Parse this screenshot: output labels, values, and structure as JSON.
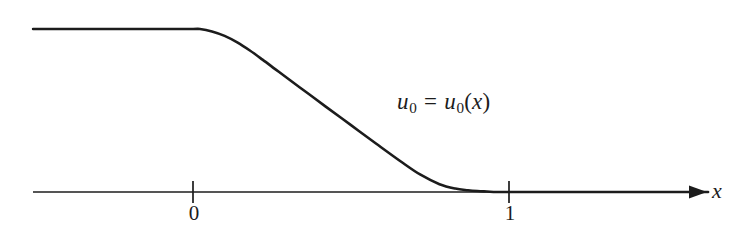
{
  "figure": {
    "background_color": "#ffffff",
    "ink_color": "#1c1c1c",
    "width": 745,
    "height": 242,
    "curve_label": {
      "full_text": "u0 = u0(x)",
      "lhs_var": "u",
      "lhs_sub": "0",
      "equals": "=",
      "rhs_var": "u",
      "rhs_sub": "0",
      "open_paren": "(",
      "arg": "x",
      "close_paren": ")"
    },
    "axis": {
      "x_axis_label": "x",
      "tick_labels": [
        "0",
        "1"
      ]
    }
  },
  "chart_data": {
    "type": "line",
    "title": "",
    "subtitle": "",
    "xlabel": "x",
    "ylabel": "",
    "grid": false,
    "legend_position": "none",
    "annotations": [
      {
        "text": "u0 = u0(x)",
        "x": 0.64,
        "y": 0.58,
        "note": "curve label placed to the right of the descending branch"
      }
    ],
    "axis_pixel_geometry": {
      "axis_y_pixel": 192,
      "axis_x_start_pixel": 33,
      "axis_x_end_pixel": 706,
      "tick_0_x_pixel": 193,
      "tick_1_x_pixel": 509,
      "tick_half_height_pixel": 11,
      "plateau_y_pixel": 29
    },
    "xlim": [
      -0.51,
      1.63
    ],
    "ylim": [
      0,
      1.12
    ],
    "xticks": [
      0,
      1
    ],
    "xticklabels": [
      "0",
      "1"
    ],
    "yticks": [],
    "yticklabels": [],
    "series": [
      {
        "name": "u0",
        "description": "smooth monotone decreasing initial datum: equals a positive constant for x <~ 0.02, decreases to 0 near x = 0.96, then stays 0",
        "x": [
          -0.506,
          -0.4,
          -0.3,
          -0.2,
          -0.1,
          0.0,
          0.022,
          0.06,
          0.1,
          0.14,
          0.18,
          0.22,
          0.26,
          0.3,
          0.36,
          0.42,
          0.5,
          0.58,
          0.66,
          0.72,
          0.78,
          0.83,
          0.87,
          0.9,
          0.93,
          0.96,
          1.0,
          1.1,
          1.25,
          1.4,
          1.55,
          1.63
        ],
        "y": [
          1.0,
          1.0,
          1.0,
          1.0,
          1.0,
          1.0,
          1.0,
          0.985,
          0.958,
          0.918,
          0.868,
          0.812,
          0.754,
          0.696,
          0.61,
          0.524,
          0.41,
          0.296,
          0.184,
          0.106,
          0.048,
          0.021,
          0.011,
          0.006,
          0.003,
          0.0,
          0.0,
          0.0,
          0.0,
          0.0,
          0.0,
          0.0
        ]
      }
    ]
  }
}
